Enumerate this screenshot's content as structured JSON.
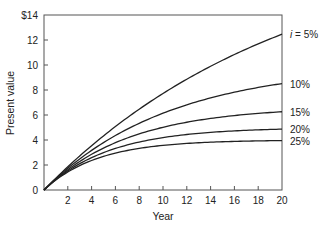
{
  "chart_data": {
    "type": "line",
    "title": "",
    "xlabel": "Year",
    "ylabel": "Present value",
    "xlim": [
      0,
      20
    ],
    "ylim": [
      0,
      14
    ],
    "x_ticks": [
      2,
      4,
      6,
      8,
      10,
      12,
      14,
      16,
      18,
      20
    ],
    "x_tick_labels": [
      "2",
      "4",
      "6",
      "8",
      "10",
      "12",
      "14",
      "16",
      "18",
      "20"
    ],
    "y_ticks": [
      0,
      2,
      4,
      6,
      8,
      10,
      12,
      14
    ],
    "y_tick_labels": [
      "0",
      "2",
      "4",
      "6",
      "8",
      "10",
      "12",
      "$14"
    ],
    "grid": false,
    "legend_position": "right, inline labels at line ends",
    "x": [
      0,
      2,
      4,
      6,
      8,
      10,
      12,
      14,
      16,
      18,
      20
    ],
    "series": [
      {
        "name": "i = 5%",
        "label": "i = 5%",
        "rate": 0.05,
        "values": [
          0,
          1.86,
          3.55,
          5.08,
          6.46,
          7.72,
          8.86,
          9.9,
          10.84,
          11.69,
          12.46
        ]
      },
      {
        "name": "10%",
        "label": "10%",
        "rate": 0.1,
        "values": [
          0,
          1.74,
          3.17,
          4.36,
          5.33,
          6.14,
          6.81,
          7.37,
          7.82,
          8.2,
          8.51
        ]
      },
      {
        "name": "15%",
        "label": "15%",
        "rate": 0.15,
        "values": [
          0,
          1.63,
          2.85,
          3.78,
          4.49,
          5.02,
          5.42,
          5.72,
          5.95,
          6.13,
          6.26
        ]
      },
      {
        "name": "20%",
        "label": "20%",
        "rate": 0.2,
        "values": [
          0,
          1.53,
          2.59,
          3.33,
          3.84,
          4.19,
          4.44,
          4.61,
          4.73,
          4.81,
          4.87
        ]
      },
      {
        "name": "25%",
        "label": "25%",
        "rate": 0.25,
        "values": [
          0,
          1.44,
          2.36,
          2.95,
          3.33,
          3.57,
          3.73,
          3.82,
          3.89,
          3.93,
          3.95
        ]
      }
    ]
  },
  "colors": {
    "line": "#222222",
    "axis": "#555555",
    "text": "#222222"
  }
}
